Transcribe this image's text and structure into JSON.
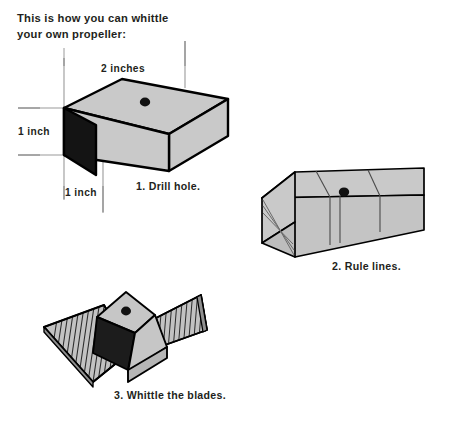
{
  "page": {
    "background": "#ffffff",
    "width": 450,
    "height": 423
  },
  "intro": {
    "line1": "This is how you can whittle",
    "line2": "your own propeller:"
  },
  "colors": {
    "ink": "#231f20",
    "wood_light": "#c9c9c9",
    "wood_mid": "#b9b9b9",
    "wood_dark": "#1a1a1a",
    "wood_shadow": "#2b2b2b",
    "dimension_line": "#9a9a9a",
    "hatch": "#262626"
  },
  "steps": [
    {
      "number": "1",
      "caption": "1. Drill hole.",
      "name": "drill-hole",
      "dimensions": [
        {
          "id": "top",
          "label": "2 inches",
          "axis": "horizontal"
        },
        {
          "id": "left",
          "label": "1 inch",
          "axis": "vertical"
        },
        {
          "id": "bottom",
          "label": "1 inch",
          "axis": "vertical"
        }
      ],
      "features": [
        "drilled-hole",
        "dark-end-face"
      ]
    },
    {
      "number": "2",
      "caption": "2. Rule lines.",
      "name": "rule-lines",
      "features": [
        "drilled-hole",
        "division-lines",
        "diagonal-guide-lines"
      ]
    },
    {
      "number": "3",
      "caption": "3. Whittle the blades.",
      "name": "whittle-the-blades",
      "features": [
        "drilled-hole",
        "left-blade-hatching",
        "right-blade-hatching",
        "carved-hub"
      ]
    }
  ]
}
